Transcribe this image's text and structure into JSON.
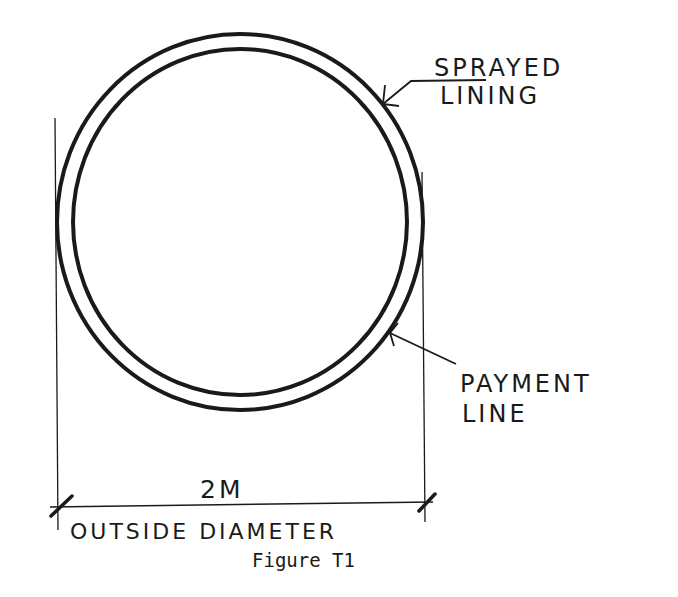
{
  "figure": {
    "caption": "Figure T1",
    "labels": {
      "sprayed_lining_line1": "SPRAYED",
      "sprayed_lining_line2": "LINING",
      "payment_line_line1": "PAYMENT",
      "payment_line_line2": "LINE",
      "dimension_value": "2M",
      "dimension_label": "OUTSIDE DIAMETER"
    },
    "colors": {
      "ink": "#1a1a1a",
      "background": "#ffffff"
    }
  }
}
